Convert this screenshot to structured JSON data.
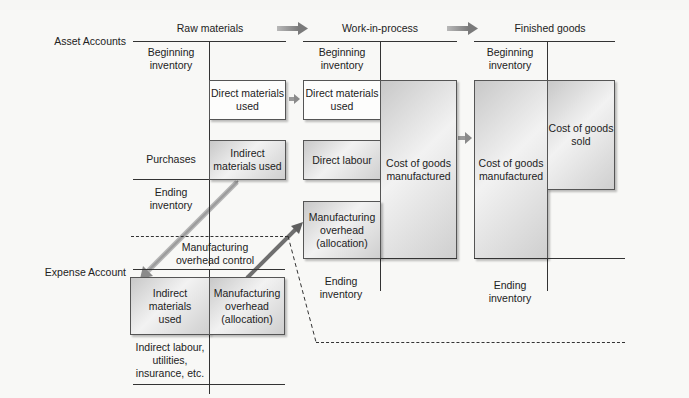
{
  "labels": {
    "asset_accounts": "Asset Accounts",
    "expense_account": "Expense Account"
  },
  "accounts": {
    "raw_materials": {
      "title": "Raw materials",
      "debit": [
        "Beginning inventory",
        "Purchases"
      ],
      "credit": [
        "Direct materials used",
        "Indirect materials used"
      ],
      "ending": "Ending inventory"
    },
    "work_in_process": {
      "title": "Work-in-process",
      "debit": [
        "Beginning inventory",
        "Direct materials used",
        "Direct labour",
        "Manufacturing overhead (allocation)"
      ],
      "credit": [
        "Cost of goods manufactured"
      ],
      "ending": "Ending inventory"
    },
    "finished_goods": {
      "title": "Finished goods",
      "debit": [
        "Beginning inventory",
        "Cost of goods manufactured"
      ],
      "credit": [
        "Cost of goods sold"
      ],
      "ending": "Ending inventory"
    },
    "manufacturing_overhead_control": {
      "title": "Manufacturing overhead control",
      "debit": [
        "Indirect materials used",
        "Indirect labour, utilities, insurance, etc."
      ],
      "credit": [
        "Manufacturing overhead (allocation)"
      ]
    }
  },
  "text": {
    "rm_title": "Raw materials",
    "wip_title": "Work-in-process",
    "fg_title": "Finished goods",
    "rm_beg_1": "Beginning",
    "rm_beg_2": "inventory",
    "rm_dmu_1": "Direct materials",
    "rm_dmu_2": "used",
    "rm_purchases": "Purchases",
    "rm_imu_1": "Indirect",
    "rm_imu_2": "materials used",
    "rm_end_1": "Ending",
    "rm_end_2": "inventory",
    "wip_beg_1": "Beginning",
    "wip_beg_2": "inventory",
    "wip_dmu_1": "Direct materials",
    "wip_dmu_2": "used",
    "wip_dl": "Direct labour",
    "wip_cogm_1": "Cost of goods",
    "wip_cogm_2": "manufactured",
    "wip_moh_1": "Manufacturing",
    "wip_moh_2": "overhead",
    "wip_moh_3": "(allocation)",
    "wip_end_1": "Ending",
    "wip_end_2": "inventory",
    "fg_beg_1": "Beginning",
    "fg_beg_2": "inventory",
    "fg_cogm_1": "Cost of goods",
    "fg_cogm_2": "manufactured",
    "fg_cogs_1": "Cost of goods",
    "fg_cogs_2": "sold",
    "fg_end_1": "Ending",
    "fg_end_2": "inventory",
    "moh_title_1": "Manufacturing",
    "moh_title_2": "overhead control",
    "moh_imu_1": "Indirect",
    "moh_imu_2": "materials",
    "moh_imu_3": "used",
    "moh_alloc_1": "Manufacturing",
    "moh_alloc_2": "overhead",
    "moh_alloc_3": "(allocation)",
    "moh_other_1": "Indirect labour,",
    "moh_other_2": "utilities,",
    "moh_other_3": "insurance, etc."
  },
  "colors": {
    "line": "#333333",
    "arrow": "#8a8a8a",
    "shaded_box": "#c8c8c8",
    "background": "#f8f8f6"
  }
}
